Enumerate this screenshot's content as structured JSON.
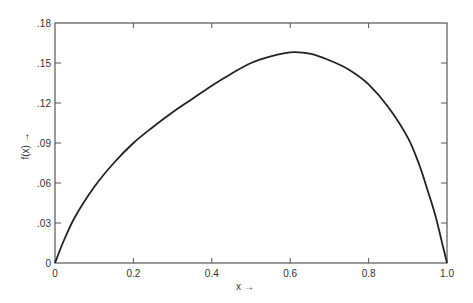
{
  "chart_data": {
    "type": "line",
    "title": "",
    "xlabel": "x →",
    "ylabel": "f(x) →",
    "xlim": [
      0,
      1.0
    ],
    "ylim": [
      0,
      0.18
    ],
    "grid": false,
    "legend": null,
    "x_ticks": [
      {
        "value": 0,
        "label": "0"
      },
      {
        "value": 0.2,
        "label": "0.2"
      },
      {
        "value": 0.4,
        "label": "0.4"
      },
      {
        "value": 0.6,
        "label": "0.6"
      },
      {
        "value": 0.8,
        "label": "0.8"
      },
      {
        "value": 1.0,
        "label": "1.0"
      }
    ],
    "y_ticks": [
      {
        "value": 0,
        "label": "0"
      },
      {
        "value": 0.03,
        "label": ".03"
      },
      {
        "value": 0.06,
        "label": ".06"
      },
      {
        "value": 0.09,
        "label": ".09"
      },
      {
        "value": 0.12,
        "label": ".12"
      },
      {
        "value": 0.15,
        "label": ".15"
      },
      {
        "value": 0.18,
        "label": ".18"
      }
    ],
    "series": [
      {
        "name": "f(x)",
        "color": "#222222",
        "x": [
          0,
          0.02,
          0.05,
          0.1,
          0.15,
          0.2,
          0.25,
          0.3,
          0.35,
          0.4,
          0.45,
          0.5,
          0.55,
          0.6,
          0.65,
          0.7,
          0.75,
          0.8,
          0.85,
          0.9,
          0.93,
          0.95,
          0.97,
          0.99,
          1.0
        ],
        "y": [
          0,
          0.015,
          0.034,
          0.057,
          0.075,
          0.09,
          0.102,
          0.113,
          0.123,
          0.133,
          0.142,
          0.15,
          0.155,
          0.158,
          0.157,
          0.152,
          0.145,
          0.134,
          0.117,
          0.094,
          0.073,
          0.055,
          0.036,
          0.012,
          0
        ]
      }
    ],
    "annotations": []
  },
  "labels": {
    "x_axis": "x →",
    "y_axis": "f(x) →"
  }
}
